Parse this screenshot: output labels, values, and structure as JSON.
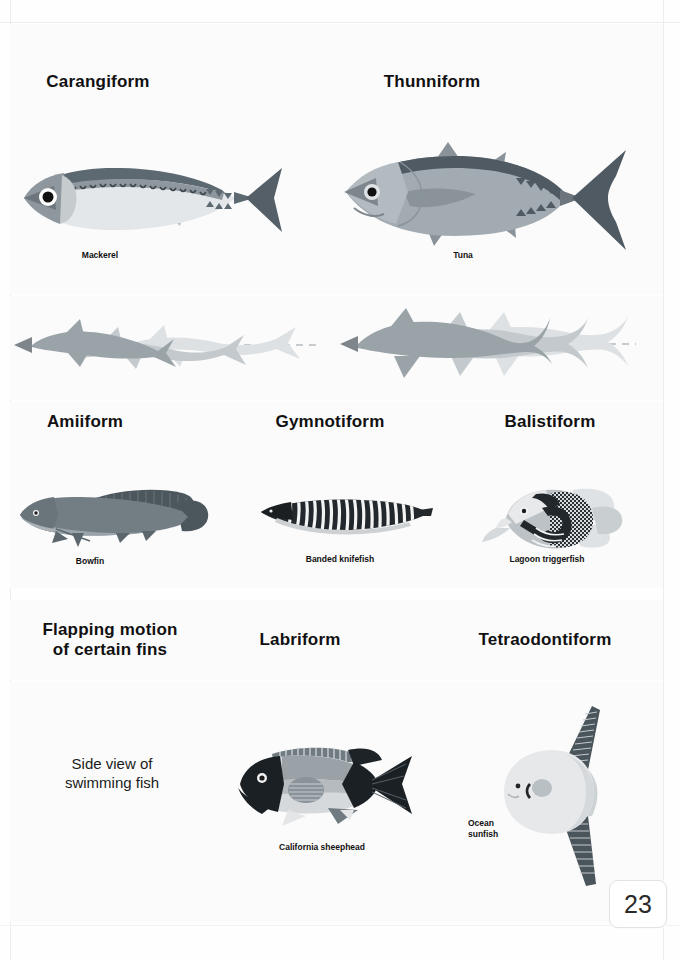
{
  "page": {
    "number": "23",
    "background": "#fefefe"
  },
  "palette": {
    "ink": "#111111",
    "dark_fin": "#4f5a63",
    "mid_body": "#98a2a9",
    "light_body": "#d9dde0",
    "pale": "#eceef0",
    "motion_dark": "#9aa3a8",
    "motion_mid": "#c3c9cc",
    "motion_light": "#dde1e3",
    "dash": "#b7bcbf",
    "black": "#1c1c1c"
  },
  "sections": [
    {
      "id": "carangiform",
      "heading": "Carangiform",
      "specimen": "Mackerel"
    },
    {
      "id": "thunniform",
      "heading": "Thunniform",
      "specimen": "Tuna"
    },
    {
      "id": "amiiform",
      "heading": "Amiiform",
      "specimen": "Bowfin"
    },
    {
      "id": "gymnotiform",
      "heading": "Gymnotiform",
      "specimen": "Banded knifefish"
    },
    {
      "id": "balistiform",
      "heading": "Balistiform",
      "specimen": "Lagoon triggerfish"
    },
    {
      "id": "labriform",
      "heading": "Labriform",
      "specimen": "California sheephead"
    },
    {
      "id": "tetraodontiform",
      "heading": "Tetraodontiform",
      "specimen": "Ocean\nsunfish"
    }
  ],
  "left_column": {
    "group_heading": "Flapping motion\nof certain fins",
    "group_note": "Side view of\nswimming fish"
  },
  "motion_rows": [
    {
      "id": "carangiform-motion",
      "frames": 3,
      "direction": "left",
      "axis": "dashed"
    },
    {
      "id": "thunniform-motion",
      "frames": 3,
      "direction": "left",
      "axis": "dashed"
    }
  ]
}
